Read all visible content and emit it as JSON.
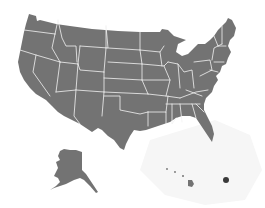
{
  "map": {
    "subject": "United States of America",
    "style": "gray filled states with white borders",
    "colors": {
      "land": "#737373",
      "borders": "#f2f2f2",
      "background": "#ffffff",
      "marker": "#3a3a3a"
    },
    "insets": [
      "Alaska",
      "Hawaii"
    ],
    "markers": [
      {
        "name": "Puerto Rico",
        "x": 226,
        "y": 180
      }
    ]
  }
}
